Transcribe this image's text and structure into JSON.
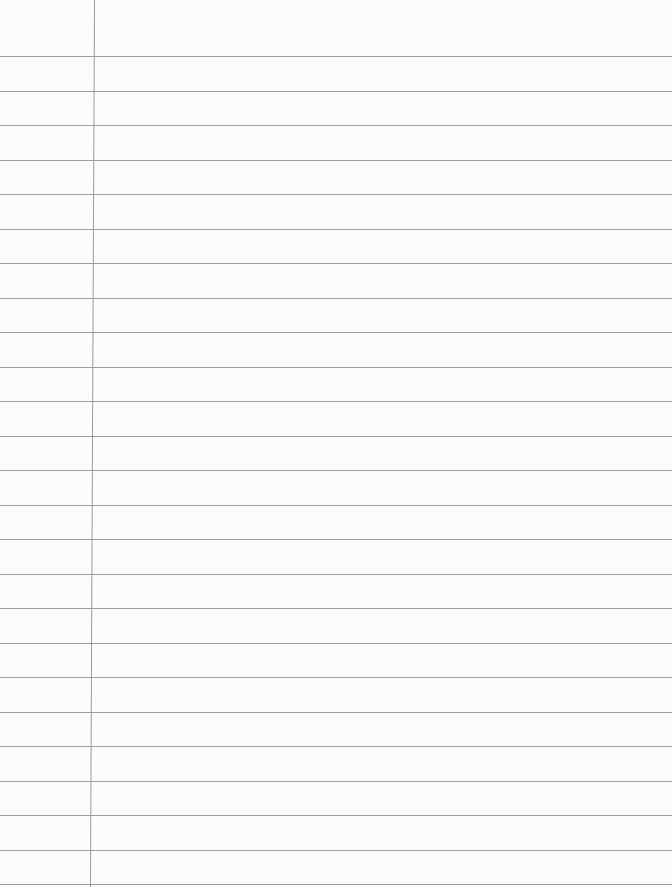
{
  "paper": {
    "type": "lined-paper",
    "content_text": "",
    "background_color": "#fcfcfc",
    "rule_color": "#8e8e8e",
    "margin_line_color": "#9a9a9a",
    "first_rule_y": 56,
    "rule_spacing": 34.5,
    "rule_count": 25,
    "margin_line_x": 94
  }
}
